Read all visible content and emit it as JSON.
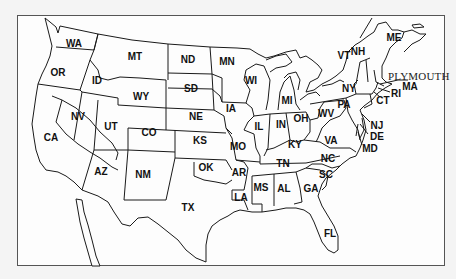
{
  "map": {
    "title": "Contiguous United States",
    "annotation": {
      "label": "PLYMOUTH",
      "target_state": "MA"
    },
    "states": [
      {
        "abbr": "WA",
        "x": 74,
        "y": 44
      },
      {
        "abbr": "OR",
        "x": 58,
        "y": 73
      },
      {
        "abbr": "ID",
        "x": 97,
        "y": 81
      },
      {
        "abbr": "MT",
        "x": 135,
        "y": 57
      },
      {
        "abbr": "ND",
        "x": 188,
        "y": 60
      },
      {
        "abbr": "MN",
        "x": 227,
        "y": 62
      },
      {
        "abbr": "WY",
        "x": 141,
        "y": 97
      },
      {
        "abbr": "SD",
        "x": 191,
        "y": 89
      },
      {
        "abbr": "NV",
        "x": 78,
        "y": 117
      },
      {
        "abbr": "UT",
        "x": 111,
        "y": 127
      },
      {
        "abbr": "CO",
        "x": 149,
        "y": 133
      },
      {
        "abbr": "NE",
        "x": 196,
        "y": 117
      },
      {
        "abbr": "KS",
        "x": 200,
        "y": 141
      },
      {
        "abbr": "CA",
        "x": 51,
        "y": 138
      },
      {
        "abbr": "AZ",
        "x": 101,
        "y": 172
      },
      {
        "abbr": "NM",
        "x": 143,
        "y": 175
      },
      {
        "abbr": "OK",
        "x": 206,
        "y": 168
      },
      {
        "abbr": "TX",
        "x": 188,
        "y": 208
      },
      {
        "abbr": "IA",
        "x": 231,
        "y": 109
      },
      {
        "abbr": "MO",
        "x": 238,
        "y": 147
      },
      {
        "abbr": "AR",
        "x": 239,
        "y": 173
      },
      {
        "abbr": "LA",
        "x": 241,
        "y": 198
      },
      {
        "abbr": "WI",
        "x": 251,
        "y": 81
      },
      {
        "abbr": "IL",
        "x": 259,
        "y": 127
      },
      {
        "abbr": "MI",
        "x": 287,
        "y": 101
      },
      {
        "abbr": "IN",
        "x": 281,
        "y": 125
      },
      {
        "abbr": "OH",
        "x": 301,
        "y": 119
      },
      {
        "abbr": "KY",
        "x": 295,
        "y": 145
      },
      {
        "abbr": "TN",
        "x": 283,
        "y": 164
      },
      {
        "abbr": "MS",
        "x": 261,
        "y": 188
      },
      {
        "abbr": "AL",
        "x": 284,
        "y": 189
      },
      {
        "abbr": "GA",
        "x": 311,
        "y": 189
      },
      {
        "abbr": "FL",
        "x": 330,
        "y": 234
      },
      {
        "abbr": "SC",
        "x": 326,
        "y": 175
      },
      {
        "abbr": "NC",
        "x": 328,
        "y": 159
      },
      {
        "abbr": "VA",
        "x": 331,
        "y": 141
      },
      {
        "abbr": "WV",
        "x": 326,
        "y": 114
      },
      {
        "abbr": "PA",
        "x": 344,
        "y": 105
      },
      {
        "abbr": "NY",
        "x": 349,
        "y": 89
      },
      {
        "abbr": "VT",
        "x": 344,
        "y": 56
      },
      {
        "abbr": "NH",
        "x": 358,
        "y": 52
      },
      {
        "abbr": "ME",
        "x": 394,
        "y": 38
      },
      {
        "abbr": "MA",
        "x": 410,
        "y": 87
      },
      {
        "abbr": "RI",
        "x": 396,
        "y": 94
      },
      {
        "abbr": "CT",
        "x": 383,
        "y": 101
      },
      {
        "abbr": "NJ",
        "x": 377,
        "y": 126
      },
      {
        "abbr": "DE",
        "x": 377,
        "y": 137
      },
      {
        "abbr": "MD",
        "x": 370,
        "y": 149
      }
    ]
  }
}
